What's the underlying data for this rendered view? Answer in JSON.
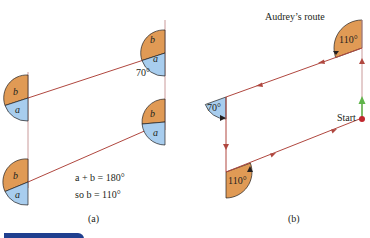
{
  "figure_a": {
    "caption": "(a)",
    "sector_labels": {
      "a": "a",
      "b": "b"
    },
    "angle_label": "70°",
    "equation_1": "a + b = 180°",
    "equation_2": "so b = 110°"
  },
  "figure_b": {
    "caption": "(b)",
    "title": "Audrey’s route",
    "angle_top_right": "110°",
    "angle_left": "70°",
    "angle_bottom_left": "110°",
    "start_label": "Start"
  },
  "colors": {
    "orange_sector": "#e09a55",
    "blue_sector": "#a8cdee",
    "line_red": "#b0473f",
    "line_pink": "#c99a9a",
    "start_dot": "#c0272d",
    "start_arrow": "#5fb44a",
    "footer_bar": "#1f3f8f"
  }
}
